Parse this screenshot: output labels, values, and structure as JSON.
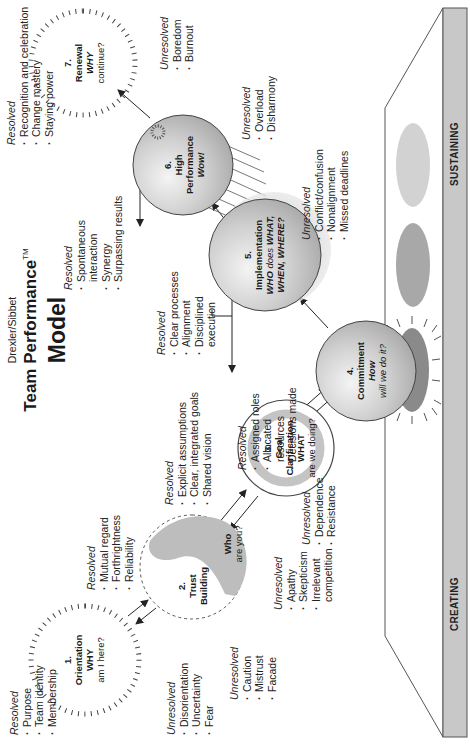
{
  "title": {
    "authors": "Drexler/Sibbet",
    "main": "Team Performance",
    "trademark": "TM",
    "model": "Model"
  },
  "platform": {
    "left_label": "CREATING",
    "right_label": "SUSTAINING",
    "colors": {
      "bar": "#c8c8c8",
      "ellipse_dark": "#8a8a8a",
      "ellipse_mid": "#a8a8a8",
      "ellipse_light": "#d2d2d2"
    }
  },
  "stages": [
    {
      "number": "1.",
      "name": "Orientation",
      "q_bold": "WHY",
      "q_rest": "am I here?",
      "resolved_label": "Resolved",
      "resolved": [
        "Purpose",
        "Team identity",
        "Membership"
      ],
      "unresolved_label": "Unresolved",
      "unresolved": [
        "Disorientation",
        "Uncertainty",
        "Fear"
      ]
    },
    {
      "number": "2.",
      "name": "Trust",
      "name2": "Building",
      "q_bold": "Who",
      "q_rest": "are you?",
      "resolved_label": "Resolved",
      "resolved": [
        "Mutual regard",
        "Forthrightness",
        "Reliability"
      ],
      "unresolved_label": "Unresolved",
      "unresolved": [
        "Caution",
        "Mistrust",
        "Facade"
      ]
    },
    {
      "number": "3.",
      "name": "Goal",
      "name2": "Clarification",
      "q_bold": "WHAT",
      "q_rest": "are we doing?",
      "resolved_label": "Resolved",
      "resolved": [
        "Explicit assumptions",
        "Clear, integrated goals",
        "Shared vision"
      ],
      "unresolved_label": "Unresolved",
      "unresolved": [
        "Apathy",
        "Skepticism",
        "Irrelevant",
        "competition"
      ]
    },
    {
      "number": "4.",
      "name": "Commitment",
      "q_bold": "How",
      "q_rest": "will we do it?",
      "resolved_label": "Resolved",
      "resolved": [
        "Assigned roles",
        "Allocated",
        "resources",
        "Decisions made"
      ],
      "unresolved_label": "Unresolved",
      "unresolved": [
        "Dependence",
        "Resistance"
      ]
    },
    {
      "number": "5.",
      "name": "Implementation",
      "q_line1_bold": "WHO",
      "q_line1_rest": "does",
      "q_line1_bold2": "WHAT,",
      "q_line2": "WHEN, WHERE?",
      "resolved_label": "Resolved",
      "resolved": [
        "Clear processes",
        "Alignment",
        "Disciplined",
        "execution"
      ],
      "unresolved_label": "Unresolved",
      "unresolved": [
        "Conflict/confusion",
        "Nonalignment",
        "Missed deadlines"
      ]
    },
    {
      "number": "6.",
      "name": "High",
      "name2": "Performance",
      "q_bold": "Wow!",
      "resolved_label": "Resolved",
      "resolved": [
        "Spontaneous",
        "interaction",
        "Synergy",
        "Surpassing results"
      ],
      "unresolved_label": "Unresolved",
      "unresolved": [
        "Overload",
        "Disharmony"
      ]
    },
    {
      "number": "7.",
      "name": "Renewal",
      "q_bold": "WHY",
      "q_rest": "continue?",
      "resolved_label": "Resolved",
      "resolved": [
        "Recognition and celebration",
        "Change mastery",
        "Staying power"
      ],
      "unresolved_label": "Unresolved",
      "unresolved": [
        "Boredom",
        "Burnout"
      ]
    }
  ]
}
